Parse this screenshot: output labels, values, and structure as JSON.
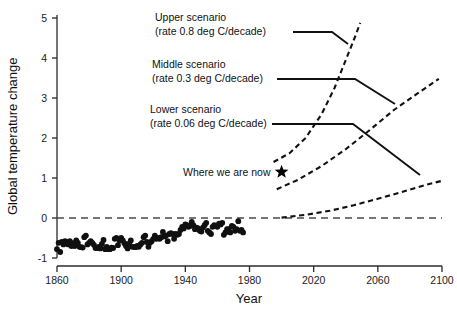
{
  "chart_data": {
    "type": "scatter",
    "title": "",
    "xlabel": "Year",
    "ylabel": "Global temperature change",
    "xlim": [
      1860,
      2100
    ],
    "ylim": [
      -1,
      5
    ],
    "grid": false,
    "legend": "none",
    "xticks": [
      1860,
      1900,
      1940,
      1980,
      2020,
      2060,
      2100
    ],
    "yticks": [
      -1,
      0,
      1,
      2,
      3,
      4,
      5
    ],
    "xtick_labels": [
      "1860",
      "1900",
      "1940",
      "1980",
      "2020",
      "2060",
      "2100"
    ],
    "ytick_labels": [
      "-1",
      "0",
      "1",
      "2",
      "3",
      "4",
      "5"
    ],
    "reference_line": {
      "y": 0,
      "style": "dashed",
      "label": ""
    },
    "annotations": [
      {
        "name": "upper-scenario",
        "line1": "Upper scenario",
        "line2": "(rate 0.8 deg C/decade)",
        "rate_deg_c_per_decade": 0.8,
        "text_x": 1905,
        "text_y": 4.75
      },
      {
        "name": "middle-scenario",
        "line1": "Middle scenario",
        "line2": "(rate 0.3 deg C/decade)",
        "rate_deg_c_per_decade": 0.3,
        "text_x": 1902,
        "text_y": 3.7
      },
      {
        "name": "lower-scenario",
        "line1": "Lower scenario",
        "line2": "(rate 0.06 deg C/decade)",
        "rate_deg_c_per_decade": 0.06,
        "text_x": 1900,
        "text_y": 2.62
      },
      {
        "name": "where-we-are-now",
        "line1": "Where we are now",
        "line2": "",
        "text_x": 1922,
        "text_y": 1.18,
        "marker": "star",
        "marker_x": 2000,
        "marker_y": 1.15
      }
    ],
    "series": [
      {
        "name": "Observed global temperature anomaly",
        "type": "scatter",
        "marker": "filled-circle",
        "color": "#101010",
        "x": [
          1860,
          1861,
          1862,
          1863,
          1864,
          1865,
          1866,
          1867,
          1868,
          1869,
          1870,
          1871,
          1872,
          1873,
          1874,
          1875,
          1876,
          1877,
          1878,
          1879,
          1880,
          1881,
          1882,
          1883,
          1884,
          1885,
          1886,
          1887,
          1888,
          1889,
          1890,
          1891,
          1892,
          1893,
          1894,
          1895,
          1896,
          1897,
          1898,
          1899,
          1900,
          1901,
          1902,
          1903,
          1904,
          1905,
          1906,
          1907,
          1908,
          1909,
          1910,
          1911,
          1912,
          1913,
          1914,
          1915,
          1916,
          1917,
          1918,
          1919,
          1920,
          1921,
          1922,
          1923,
          1924,
          1925,
          1926,
          1927,
          1928,
          1929,
          1930,
          1931,
          1932,
          1933,
          1934,
          1935,
          1936,
          1937,
          1938,
          1939,
          1940,
          1941,
          1942,
          1943,
          1944,
          1945,
          1946,
          1947,
          1948,
          1949,
          1950,
          1951,
          1952,
          1953,
          1954,
          1955,
          1956,
          1957,
          1958,
          1959,
          1960,
          1961,
          1962,
          1963,
          1964,
          1965,
          1966,
          1967,
          1968,
          1969,
          1970,
          1971,
          1972,
          1973,
          1974,
          1975,
          1976
        ],
        "y": [
          -0.78,
          -0.62,
          -0.85,
          -0.6,
          -0.66,
          -0.58,
          -0.6,
          -0.66,
          -0.58,
          -0.7,
          -0.63,
          -0.7,
          -0.56,
          -0.62,
          -0.72,
          -0.73,
          -0.74,
          -0.48,
          -0.44,
          -0.66,
          -0.62,
          -0.58,
          -0.62,
          -0.67,
          -0.75,
          -0.75,
          -0.72,
          -0.76,
          -0.65,
          -0.55,
          -0.78,
          -0.72,
          -0.78,
          -0.78,
          -0.74,
          -0.75,
          -0.52,
          -0.5,
          -0.68,
          -0.56,
          -0.5,
          -0.56,
          -0.63,
          -0.7,
          -0.76,
          -0.64,
          -0.56,
          -0.72,
          -0.72,
          -0.73,
          -0.7,
          -0.72,
          -0.66,
          -0.62,
          -0.48,
          -0.44,
          -0.6,
          -0.72,
          -0.62,
          -0.58,
          -0.52,
          -0.44,
          -0.52,
          -0.5,
          -0.52,
          -0.48,
          -0.35,
          -0.46,
          -0.44,
          -0.58,
          -0.4,
          -0.38,
          -0.4,
          -0.52,
          -0.4,
          -0.42,
          -0.4,
          -0.3,
          -0.22,
          -0.26,
          -0.16,
          -0.18,
          -0.22,
          -0.2,
          -0.1,
          -0.18,
          -0.28,
          -0.24,
          -0.26,
          -0.32,
          -0.34,
          -0.24,
          -0.18,
          -0.12,
          -0.32,
          -0.36,
          -0.4,
          -0.22,
          -0.18,
          -0.2,
          -0.22,
          -0.14,
          -0.16,
          -0.12,
          -0.42,
          -0.36,
          -0.28,
          -0.28,
          -0.36,
          -0.2,
          -0.22,
          -0.32,
          -0.28,
          -0.08,
          -0.32,
          -0.3,
          -0.36
        ]
      },
      {
        "name": "Upper scenario projection",
        "type": "line",
        "style": "dashed",
        "color": "#111111",
        "x": [
          1995,
          2005,
          2015,
          2025,
          2033,
          2040,
          2046,
          2049
        ],
        "y": [
          1.4,
          1.62,
          2.0,
          2.6,
          3.25,
          3.95,
          4.55,
          4.88
        ]
      },
      {
        "name": "Middle scenario projection",
        "type": "line",
        "style": "dashed",
        "color": "#111111",
        "x": [
          1997,
          2010,
          2025,
          2040,
          2055,
          2070,
          2085,
          2098
        ],
        "y": [
          0.72,
          0.95,
          1.3,
          1.72,
          2.2,
          2.7,
          3.12,
          3.48
        ]
      },
      {
        "name": "Lower scenario projection",
        "type": "line",
        "style": "dashed",
        "color": "#111111",
        "x": [
          2000,
          2015,
          2030,
          2045,
          2060,
          2075,
          2090,
          2100
        ],
        "y": [
          0.01,
          0.08,
          0.18,
          0.32,
          0.48,
          0.65,
          0.83,
          0.93
        ]
      }
    ]
  },
  "axes": {
    "y_title": "Global temperature change",
    "x_title": "Year"
  },
  "colors": {
    "ink": "#111111",
    "axis": "#2b2b2b",
    "zero_line": "#4a4a4a",
    "background": "#ffffff"
  }
}
